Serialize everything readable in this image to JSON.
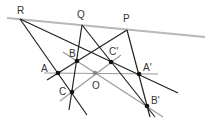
{
  "diagram": {
    "colors": {
      "dark_line": "#222222",
      "gray_line": "#9a9a9a",
      "axis_line": "#b8b8b8",
      "point": "#111111",
      "center_point": "#888888",
      "label": "#333333"
    },
    "points": [
      {
        "id": "R",
        "label": "R",
        "x": 20,
        "y": 19,
        "lx": 17,
        "ly": 14
      },
      {
        "id": "Q",
        "label": "Q",
        "x": 82,
        "y": 25,
        "lx": 77,
        "ly": 18
      },
      {
        "id": "P",
        "label": "P",
        "x": 127,
        "y": 30,
        "lx": 123,
        "ly": 22
      },
      {
        "id": "B",
        "label": "B",
        "x": 77,
        "y": 61,
        "lx": 69,
        "ly": 57
      },
      {
        "id": "Cp",
        "label": "C'",
        "x": 111,
        "y": 62,
        "lx": 109,
        "ly": 55
      },
      {
        "id": "A",
        "label": "A",
        "x": 58,
        "y": 73,
        "lx": 41,
        "ly": 72
      },
      {
        "id": "O",
        "label": "O",
        "x": 95,
        "y": 73,
        "lx": 92,
        "ly": 89
      },
      {
        "id": "Ap",
        "label": "A'",
        "x": 139,
        "y": 74,
        "lx": 143,
        "ly": 71
      },
      {
        "id": "C",
        "label": "C",
        "x": 72,
        "y": 92,
        "lx": 59,
        "ly": 95
      },
      {
        "id": "Bp",
        "label": "B'",
        "x": 147,
        "y": 106,
        "lx": 151,
        "ly": 104
      }
    ]
  }
}
